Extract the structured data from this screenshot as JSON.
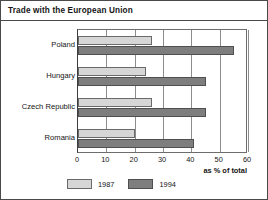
{
  "chart_data": {
    "type": "bar",
    "orientation": "horizontal",
    "title": "Trade with the European Union",
    "xlabel": "as % of total",
    "ylabel": "",
    "xlim": [
      0,
      60
    ],
    "xticks": [
      0,
      10,
      20,
      30,
      40,
      50,
      60
    ],
    "grid": true,
    "legend_position": "bottom",
    "categories": [
      "Poland",
      "Hungary",
      "Czech Republic",
      "Romania"
    ],
    "series": [
      {
        "name": "1987",
        "color": "#d6d6d6",
        "values": [
          26,
          24,
          26,
          20
        ]
      },
      {
        "name": "1994",
        "color": "#7e7e7e",
        "values": [
          55,
          45,
          45,
          41
        ]
      }
    ]
  },
  "figure": {
    "title": "Trade with the European Union",
    "axis_caption": "as % of total"
  }
}
